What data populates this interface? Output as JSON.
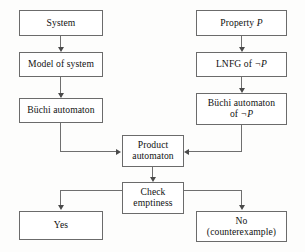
{
  "diagram": {
    "type": "flowchart",
    "line_color": "#6f6f6f",
    "box_border_color": "#6b6b6b",
    "background": "#fdfdfc",
    "nodes": {
      "system": {
        "label": "System"
      },
      "model_of_system": {
        "label": "Model of system"
      },
      "buchi_automaton": {
        "label": "Büchi automaton"
      },
      "property_p": {
        "label_prefix": "Property ",
        "label_symbol": "P"
      },
      "lnfg": {
        "label_prefix": "LNFG of ",
        "label_symbol": "¬P"
      },
      "buchi_neg": {
        "line1": "Büchi automaton",
        "line2_prefix": "of ",
        "line2_symbol": "¬P"
      },
      "product_automaton": {
        "line1": "Product",
        "line2": "automaton"
      },
      "check_emptiness": {
        "line1": "Check",
        "line2": "emptiness"
      },
      "yes": {
        "label": "Yes"
      },
      "no": {
        "line1": "No",
        "line2": "(counterexample)"
      }
    },
    "edges": [
      {
        "from": "system",
        "to": "model_of_system"
      },
      {
        "from": "model_of_system",
        "to": "buchi_automaton"
      },
      {
        "from": "property_p",
        "to": "lnfg"
      },
      {
        "from": "lnfg",
        "to": "buchi_neg"
      },
      {
        "from": "buchi_automaton",
        "to": "product_automaton"
      },
      {
        "from": "buchi_neg",
        "to": "product_automaton"
      },
      {
        "from": "product_automaton",
        "to": "check_emptiness"
      },
      {
        "from": "check_emptiness",
        "to": "yes"
      },
      {
        "from": "check_emptiness",
        "to": "no"
      }
    ]
  }
}
